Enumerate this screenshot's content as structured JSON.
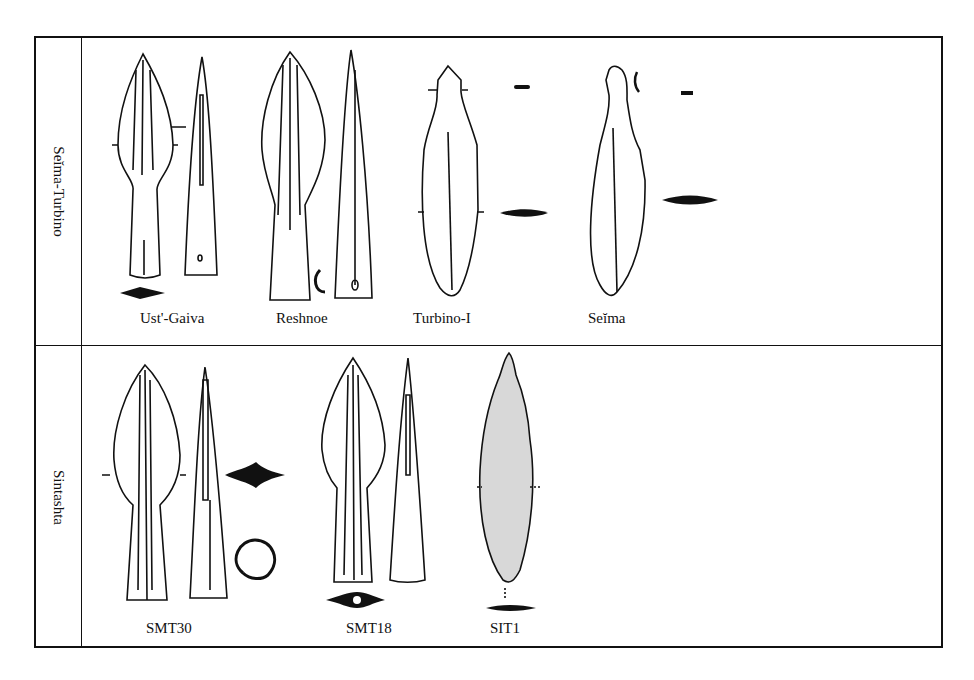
{
  "figure": {
    "rows": [
      {
        "label": "Seĭma-Turbino",
        "items": [
          {
            "caption": "Ust'-Gaiva"
          },
          {
            "caption": "Reshnoe"
          },
          {
            "caption": "Turbino-I"
          },
          {
            "caption": "Seĭma"
          }
        ]
      },
      {
        "label": "Sintashta",
        "items": [
          {
            "caption": "SMT30"
          },
          {
            "caption": "SMT18"
          },
          {
            "caption": "SIT1"
          }
        ]
      }
    ]
  }
}
